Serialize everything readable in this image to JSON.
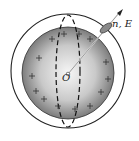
{
  "diagram": {
    "center_label": "O",
    "vector_label": "n, E",
    "charge_symbol": "+",
    "colors": {
      "sphere_edge": "#7a7a7a",
      "sphere_center": "#f4f4f4",
      "stroke": "#222222",
      "patch": "#8a8a8a"
    }
  }
}
